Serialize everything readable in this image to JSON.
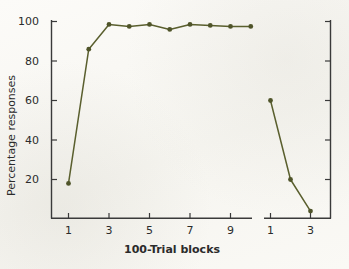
{
  "chart_data": {
    "type": "line",
    "title": "",
    "xlabel": "100-Trial blocks",
    "ylabel": "Percentage responses",
    "ylim": [
      0,
      103
    ],
    "yticks": [
      20,
      40,
      60,
      80,
      100
    ],
    "ytick_labels": [
      "20",
      "40",
      "60",
      "80",
      "100"
    ],
    "grid": false,
    "legend": "none",
    "marker": "filled-circle",
    "line_color": "#5a5f2e",
    "panels": [
      {
        "name": "acquisition",
        "xlim": [
          0.5,
          10.5
        ],
        "xticks": [
          1,
          3,
          5,
          7,
          9
        ],
        "xtick_labels": [
          "1",
          "3",
          "5",
          "7",
          "9"
        ],
        "x": [
          1,
          2,
          3,
          4,
          5,
          6,
          7,
          8,
          9,
          10
        ],
        "values": [
          18,
          86,
          98.5,
          97.5,
          98.5,
          96,
          98.5,
          98,
          97.5,
          97.5
        ]
      },
      {
        "name": "reversal",
        "xlim": [
          0.6,
          3.6
        ],
        "xticks": [
          1,
          3
        ],
        "xtick_labels": [
          "1",
          "3"
        ],
        "x": [
          1,
          2,
          3
        ],
        "values": [
          60,
          20,
          4
        ]
      }
    ]
  },
  "figure": {
    "background_color": "#fbfaf7",
    "axis_color": "#3a3a3a",
    "text_color": "#2b2b2b"
  }
}
